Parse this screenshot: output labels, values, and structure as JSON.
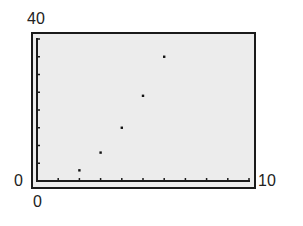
{
  "window": {
    "ymax_label": "40",
    "ymin_label": "0",
    "xmin_label": "0",
    "xmax_label": "10"
  },
  "colors": {
    "background": "#ececec",
    "axis": "#1a1a1a",
    "point": "#111111"
  },
  "chart_data": {
    "type": "scatter",
    "title": "",
    "xlabel": "",
    "ylabel": "",
    "xlim": [
      0,
      10
    ],
    "ylim": [
      0,
      40
    ],
    "x_tick_step": 1,
    "y_tick_step": 5,
    "grid": false,
    "legend": null,
    "series": [
      {
        "name": "data",
        "x": [
          2,
          3,
          4,
          5,
          6
        ],
        "y": [
          3,
          8,
          15,
          24,
          35
        ]
      }
    ]
  }
}
